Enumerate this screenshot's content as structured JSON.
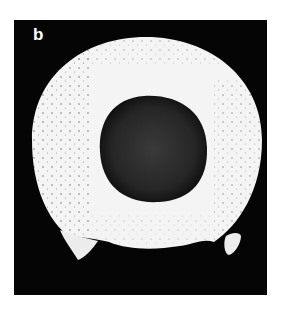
{
  "figure": {
    "panel_label": "b",
    "colors": {
      "background": "#050505",
      "ring": "#f4f4f4",
      "speckle": "#6a6a6a",
      "hole": "#262626",
      "page": "#ffffff"
    }
  }
}
